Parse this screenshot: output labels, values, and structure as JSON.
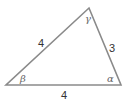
{
  "diagram": {
    "type": "triangle",
    "stroke_color": "#8a8a8a",
    "vertices": {
      "left": {
        "x": 6,
        "y": 85
      },
      "right": {
        "x": 121,
        "y": 85
      },
      "top": {
        "x": 89,
        "y": 8
      }
    },
    "sides": [
      {
        "id": "left-side",
        "label": "4",
        "x": 41,
        "y": 46
      },
      {
        "id": "right-side",
        "label": "3",
        "x": 113,
        "y": 52
      },
      {
        "id": "bottom-side",
        "label": "4",
        "x": 64,
        "y": 99
      }
    ],
    "angles": [
      {
        "id": "beta",
        "label": "β",
        "x": 20,
        "y": 82
      },
      {
        "id": "alpha",
        "label": "α",
        "x": 108,
        "y": 82
      },
      {
        "id": "gamma",
        "label": "γ",
        "x": 85,
        "y": 22
      }
    ]
  }
}
